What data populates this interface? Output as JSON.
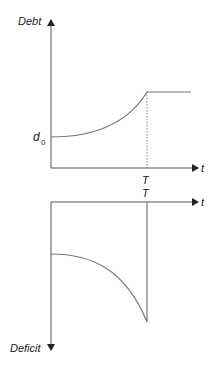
{
  "top_chart": {
    "y_axis_label": "Debt",
    "x_axis_label": "t",
    "y_tick_label": "d",
    "y_tick_subscript": "0",
    "x_tick_label": "T",
    "description": "Debt rises convexly from d0 until time T, then stays constant"
  },
  "bottom_chart": {
    "y_axis_label": "Deficit",
    "x_axis_label": "t",
    "x_tick_label": "T",
    "description": "Deficit (plotted downward) grows until time T, then drops to zero"
  },
  "colors": {
    "axis": "#333333",
    "curve": "#777777",
    "background": "#ffffff"
  }
}
